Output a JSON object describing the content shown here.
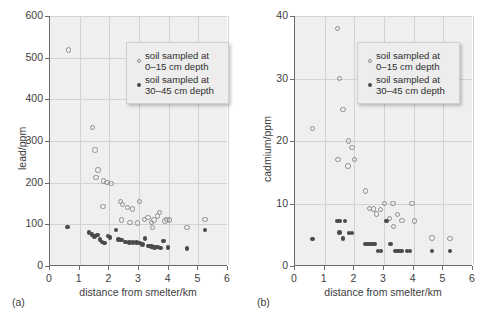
{
  "figure": {
    "panels": [
      {
        "tag": "(a)",
        "xlabel": "distance from smelter/km",
        "ylabel": "lead/ppm",
        "xticks": [
          "0",
          "1",
          "2",
          "3",
          "4",
          "5",
          "6"
        ],
        "yticks": [
          "0",
          "100",
          "200",
          "300",
          "400",
          "500",
          "600"
        ],
        "legend": [
          {
            "marker": "open-circle",
            "line1": "soil sampled at",
            "line2": "0–15 cm depth"
          },
          {
            "marker": "filled-circle",
            "line1": "soil sampled at",
            "line2": "30–45 cm depth"
          }
        ]
      },
      {
        "tag": "(b)",
        "xlabel": "distance from smelter/km",
        "ylabel": "cadmium/ppm",
        "xticks": [
          "0",
          "1",
          "2",
          "3",
          "4",
          "5",
          "6"
        ],
        "yticks": [
          "0",
          "10",
          "20",
          "30",
          "40"
        ],
        "legend": [
          {
            "marker": "open-circle",
            "line1": "soil sampled at",
            "line2": "0–15 cm depth"
          },
          {
            "marker": "filled-circle",
            "line1": "soil sampled at",
            "line2": "30–45 cm depth"
          }
        ]
      }
    ],
    "colors": {
      "plot_background": "#efefef",
      "gridline": "#d2d2d2",
      "axis": "#6b6b6b",
      "open_marker": "#8d8d8d",
      "filled_marker": "#4a4a4a",
      "legend_background": "#ededed",
      "text": "#3c3c3c"
    }
  },
  "chart_data": [
    {
      "type": "scatter",
      "panel": "(a)",
      "title": "",
      "xlabel": "distance from smelter/km",
      "ylabel": "lead/ppm",
      "xlim": [
        0,
        6
      ],
      "ylim": [
        0,
        600
      ],
      "xticks": [
        0,
        1,
        2,
        3,
        4,
        5,
        6
      ],
      "yticks": [
        0,
        100,
        200,
        300,
        400,
        500,
        600
      ],
      "grid": true,
      "legend_position": "upper-right",
      "series": [
        {
          "name": "soil sampled at 0–15 cm depth",
          "marker": "open-circle",
          "points": [
            [
              0.62,
              518
            ],
            [
              1.43,
              333
            ],
            [
              1.52,
              278
            ],
            [
              1.62,
              230
            ],
            [
              1.55,
              213
            ],
            [
              1.8,
              204
            ],
            [
              1.92,
              201
            ],
            [
              2.05,
              198
            ],
            [
              1.78,
              143
            ],
            [
              2.38,
              155
            ],
            [
              2.45,
              148
            ],
            [
              2.62,
              141
            ],
            [
              2.78,
              137
            ],
            [
              3.02,
              155
            ],
            [
              2.4,
              110
            ],
            [
              2.7,
              105
            ],
            [
              2.95,
              103
            ],
            [
              3.18,
              112
            ],
            [
              3.3,
              117
            ],
            [
              3.42,
              104
            ],
            [
              3.5,
              110
            ],
            [
              3.62,
              120
            ],
            [
              3.7,
              128
            ],
            [
              3.88,
              108
            ],
            [
              3.95,
              112
            ],
            [
              3.45,
              92
            ],
            [
              4.02,
              110
            ],
            [
              4.62,
              93
            ],
            [
              5.22,
              112
            ]
          ]
        },
        {
          "name": "soil sampled at 30–45 cm depth",
          "marker": "filled-circle",
          "points": [
            [
              0.58,
              94
            ],
            [
              1.32,
              80
            ],
            [
              1.42,
              76
            ],
            [
              1.5,
              71
            ],
            [
              1.6,
              74
            ],
            [
              1.68,
              63
            ],
            [
              1.75,
              58
            ],
            [
              1.83,
              55
            ],
            [
              1.95,
              72
            ],
            [
              2.02,
              68
            ],
            [
              2.22,
              86
            ],
            [
              2.3,
              63
            ],
            [
              2.42,
              62
            ],
            [
              2.55,
              58
            ],
            [
              2.68,
              57
            ],
            [
              2.8,
              56
            ],
            [
              2.92,
              57
            ],
            [
              3.02,
              55
            ],
            [
              3.12,
              52
            ],
            [
              3.2,
              66
            ],
            [
              3.32,
              48
            ],
            [
              3.42,
              47
            ],
            [
              3.52,
              45
            ],
            [
              3.62,
              46
            ],
            [
              3.72,
              43
            ],
            [
              3.82,
              60
            ],
            [
              3.98,
              44
            ],
            [
              4.62,
              42
            ],
            [
              5.22,
              86
            ]
          ]
        }
      ]
    },
    {
      "type": "scatter",
      "panel": "(b)",
      "title": "",
      "xlabel": "distance from smelter/km",
      "ylabel": "cadmium/ppm",
      "xlim": [
        0,
        6
      ],
      "ylim": [
        0,
        40
      ],
      "xticks": [
        0,
        1,
        2,
        3,
        4,
        5,
        6
      ],
      "yticks": [
        0,
        10,
        20,
        30,
        40
      ],
      "grid": true,
      "legend_position": "upper-right",
      "series": [
        {
          "name": "soil sampled at 0–15 cm depth",
          "marker": "open-circle",
          "points": [
            [
              1.43,
              38.0
            ],
            [
              1.5,
              30.0
            ],
            [
              1.62,
              25.0
            ],
            [
              0.58,
              22.0
            ],
            [
              1.8,
              20.0
            ],
            [
              1.92,
              19.0
            ],
            [
              1.45,
              17.0
            ],
            [
              2.0,
              17.0
            ],
            [
              1.78,
              16.0
            ],
            [
              2.38,
              12.0
            ],
            [
              3.02,
              10.0
            ],
            [
              3.3,
              10.0
            ],
            [
              3.95,
              10.0
            ],
            [
              2.52,
              9.2
            ],
            [
              2.65,
              9.1
            ],
            [
              2.88,
              9.0
            ],
            [
              2.75,
              8.3
            ],
            [
              3.45,
              8.2
            ],
            [
              3.18,
              7.6
            ],
            [
              3.6,
              7.3
            ],
            [
              4.02,
              7.2
            ],
            [
              3.32,
              6.3
            ],
            [
              4.62,
              4.5
            ],
            [
              5.22,
              4.4
            ]
          ]
        },
        {
          "name": "soil sampled at 30–45 cm depth",
          "marker": "filled-circle",
          "points": [
            [
              0.58,
              4.3
            ],
            [
              1.42,
              7.2
            ],
            [
              1.5,
              7.2
            ],
            [
              1.68,
              7.2
            ],
            [
              1.5,
              5.4
            ],
            [
              1.62,
              4.4
            ],
            [
              1.82,
              5.3
            ],
            [
              1.92,
              5.3
            ],
            [
              2.38,
              3.5
            ],
            [
              2.48,
              3.5
            ],
            [
              2.58,
              3.5
            ],
            [
              2.68,
              3.5
            ],
            [
              2.8,
              2.4
            ],
            [
              2.9,
              2.4
            ],
            [
              3.08,
              7.2
            ],
            [
              3.22,
              3.5
            ],
            [
              3.38,
              2.4
            ],
            [
              3.48,
              2.4
            ],
            [
              3.58,
              2.4
            ],
            [
              3.78,
              2.4
            ],
            [
              3.88,
              2.4
            ],
            [
              4.62,
              2.4
            ],
            [
              5.22,
              2.4
            ]
          ]
        }
      ]
    }
  ]
}
